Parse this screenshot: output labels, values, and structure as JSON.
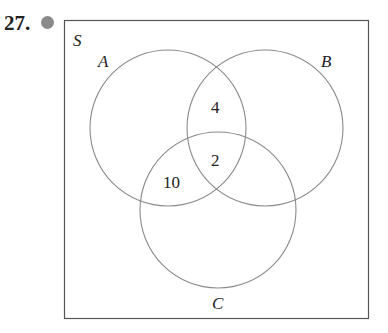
{
  "problem": {
    "number": "27.",
    "marker_color": "#8a8a8a"
  },
  "diagram": {
    "universe_label": "S",
    "sets": [
      {
        "label": "A",
        "cx": 168,
        "cy": 128,
        "r": 78
      },
      {
        "label": "B",
        "cx": 265,
        "cy": 128,
        "r": 78
      },
      {
        "label": "C",
        "cx": 218,
        "cy": 210,
        "r": 78
      }
    ],
    "regions": [
      {
        "name": "A∩B only",
        "value": "4"
      },
      {
        "name": "A∩B∩C",
        "value": "2"
      },
      {
        "name": "A∩C only",
        "value": "10"
      }
    ]
  }
}
